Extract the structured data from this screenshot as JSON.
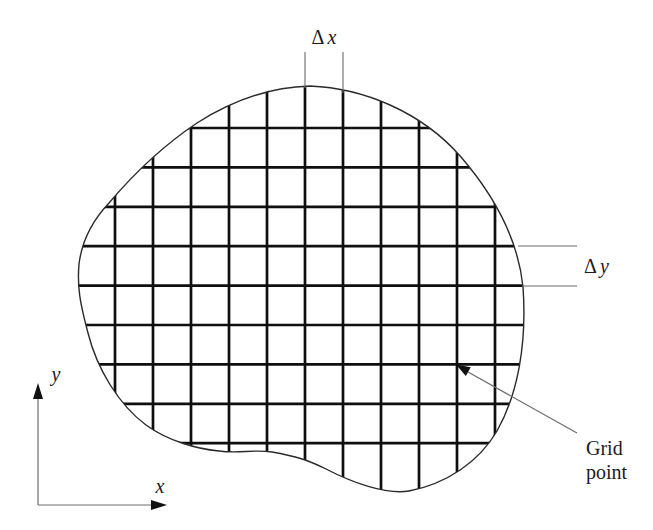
{
  "figure": {
    "background_color": "#ffffff"
  },
  "annotations": {
    "dx": {
      "delta": "Δ",
      "variable": "x"
    },
    "dy": {
      "delta": "Δ",
      "variable": "y"
    },
    "grid_point": {
      "line1": "Grid",
      "line2": "point"
    }
  },
  "axes": {
    "x_label": "x",
    "y_label": "y"
  },
  "grid": {
    "vertical_lines": 11,
    "horizontal_lines": 9,
    "x_start": 115,
    "x_spacing": 38,
    "y_start": 128,
    "y_spacing": 39.4
  },
  "colors": {
    "grid_line": "#0f0f0f",
    "boundary": "#2a2a2a",
    "annotation_line": "#6b6b6b",
    "arrowhead": "#111111",
    "text": "#1c1c1c"
  }
}
